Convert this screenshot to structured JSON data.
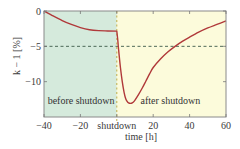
{
  "chart_data": {
    "type": "line",
    "title": "",
    "xlabel": "time [h]",
    "ylabel": "k − 1 [%]",
    "xlim": [
      -40,
      60
    ],
    "ylim": [
      -15,
      0
    ],
    "x_ticks": [
      {
        "value": -40,
        "label": "−40"
      },
      {
        "value": -20,
        "label": "−20"
      },
      {
        "value": 0,
        "label": "shutdown"
      },
      {
        "value": 20,
        "label": "20"
      },
      {
        "value": 40,
        "label": "40"
      },
      {
        "value": 60,
        "label": "60"
      }
    ],
    "y_ticks": [
      {
        "value": 0,
        "label": "0"
      },
      {
        "value": -5,
        "label": "−5"
      },
      {
        "value": -10,
        "label": "−10"
      }
    ],
    "grid": false,
    "regions": [
      {
        "name": "before shutdown",
        "x_range": [
          -40,
          0
        ],
        "color": "#d5eadc"
      },
      {
        "name": "after shutdown",
        "x_range": [
          0,
          60
        ],
        "color": "#fcfbdb"
      }
    ],
    "annotations": [
      {
        "text": "before shutdown",
        "x": -38,
        "y": -13.2
      },
      {
        "text": "after shutdown",
        "x": 13,
        "y": -13.2
      }
    ],
    "reference_lines": [
      {
        "orientation": "horizontal",
        "value": -5,
        "style": "dashed",
        "color": "#3d5a4a"
      },
      {
        "orientation": "vertical",
        "value": 0,
        "style": "dashed",
        "color": "#b9a53a"
      }
    ],
    "series": [
      {
        "name": "k − 1",
        "color": "#b0393a",
        "x": [
          -40,
          -35,
          -30,
          -25,
          -20,
          -15,
          -10,
          -5,
          0,
          0.5,
          1,
          2,
          3,
          4,
          5,
          6,
          7,
          8,
          9,
          10,
          12,
          14,
          16,
          18,
          20,
          24,
          28,
          32,
          36,
          40,
          45,
          50,
          55,
          60
        ],
        "y": [
          0,
          -0.7,
          -1.35,
          -1.9,
          -2.35,
          -2.65,
          -2.78,
          -2.82,
          -2.85,
          -4.0,
          -5.5,
          -8.0,
          -10.0,
          -11.5,
          -12.5,
          -12.9,
          -13.05,
          -13.05,
          -12.9,
          -12.6,
          -11.8,
          -10.9,
          -9.9,
          -8.9,
          -8.0,
          -6.8,
          -5.8,
          -5.0,
          -4.3,
          -3.7,
          -3.0,
          -2.4,
          -1.9,
          -1.4
        ]
      }
    ]
  }
}
